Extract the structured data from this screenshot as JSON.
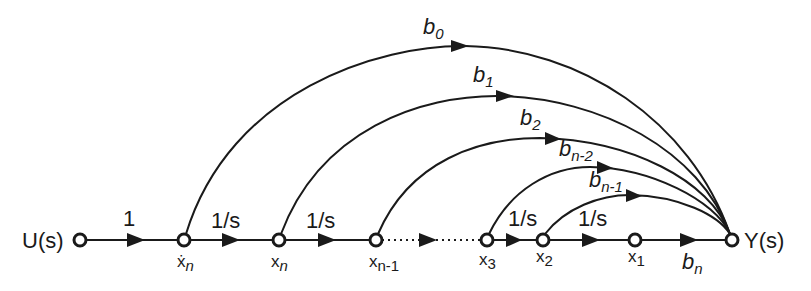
{
  "diagram": {
    "type": "signal-flow-graph",
    "input": {
      "label": "U(s)"
    },
    "output": {
      "label": "Y(s)"
    },
    "nodes": [
      {
        "id": "U",
        "label": "U(s)",
        "x": 80
      },
      {
        "id": "xdot_n",
        "label": "ẋ",
        "sub": "n",
        "x": 184
      },
      {
        "id": "x_n",
        "label": "x",
        "sub": "n",
        "x": 279
      },
      {
        "id": "x_n-1",
        "label": "x",
        "sub": "n-1",
        "x": 376
      },
      {
        "id": "x_3",
        "label": "x",
        "sub": "3",
        "x": 487
      },
      {
        "id": "x_2",
        "label": "x",
        "sub": "2",
        "x": 543
      },
      {
        "id": "x_1",
        "label": "x",
        "sub": "1",
        "x": 635
      },
      {
        "id": "Y",
        "label": "Y(s)",
        "x": 732
      }
    ],
    "forward_edges": [
      {
        "from": "U",
        "to": "xdot_n",
        "gain": "1"
      },
      {
        "from": "xdot_n",
        "to": "x_n",
        "gain": "1/s"
      },
      {
        "from": "x_n",
        "to": "x_n-1",
        "gain": "1/s"
      },
      {
        "from": "x_n-1",
        "to": "x_3",
        "gain": "",
        "style": "dotted"
      },
      {
        "from": "x_3",
        "to": "x_2",
        "gain": "1/s"
      },
      {
        "from": "x_2",
        "to": "x_1",
        "gain": "1/s"
      },
      {
        "from": "x_1",
        "to": "Y",
        "gain": "b",
        "sub": "n"
      }
    ],
    "feedforward_edges": [
      {
        "from": "xdot_n",
        "to": "Y",
        "gain": "b",
        "sub": "0"
      },
      {
        "from": "x_n",
        "to": "Y",
        "gain": "b",
        "sub": "1"
      },
      {
        "from": "x_n-1",
        "to": "Y",
        "gain": "b",
        "sub": "2"
      },
      {
        "from": "x_3",
        "to": "Y",
        "gain": "b",
        "sub": "n-2"
      },
      {
        "from": "x_2",
        "to": "Y",
        "gain": "b",
        "sub": "n-1"
      }
    ],
    "labels": {
      "u": "U(s)",
      "y": "Y(s)",
      "one": "1",
      "inv_s": "1/s",
      "b": "b",
      "x": "x",
      "xdot": "ẋ",
      "sub_n": "n",
      "sub_n1": "n-1",
      "sub_3": "3",
      "sub_2": "2",
      "sub_1": "1",
      "sub_0": "0",
      "sub_b1": "1",
      "sub_b2": "2",
      "sub_bn2": "n-2",
      "sub_bn1": "n-1",
      "sub_bn": "n"
    },
    "colors": {
      "ink": "#1a1a1a",
      "background": "#ffffff"
    }
  }
}
